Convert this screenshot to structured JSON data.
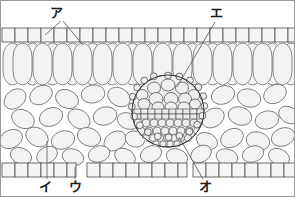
{
  "figure": {
    "type": "botanical-cross-section",
    "background_color": "#ffffff",
    "frame_color": "#9a9a9a",
    "width": 295,
    "height": 197
  },
  "style": {
    "cell_outline_color": "#4a4a4a",
    "cell_fill_color": "#f3f3f1",
    "epidermis_fill_color": "#f5f5f3",
    "bundle_outline_color": "#333333",
    "leader_line_color": "#555555",
    "label_color": "#1a1a1a"
  },
  "labels": [
    {
      "id": "a",
      "text": "ア",
      "x": 55,
      "y": 16,
      "leaders": [
        [
          60,
          20,
          44,
          34
        ],
        [
          62,
          20,
          82,
          44
        ]
      ]
    },
    {
      "id": "i",
      "text": "イ",
      "x": 44,
      "y": 190,
      "leaders": [
        [
          46,
          178,
          46,
          140
        ]
      ]
    },
    {
      "id": "u",
      "text": "ウ",
      "x": 74,
      "y": 190,
      "leaders": [
        [
          74,
          178,
          74,
          166
        ]
      ]
    },
    {
      "id": "e",
      "text": "エ",
      "x": 215,
      "y": 16,
      "leaders": [
        [
          214,
          20,
          176,
          86
        ]
      ]
    },
    {
      "id": "o",
      "text": "オ",
      "x": 204,
      "y": 190,
      "leaders": [
        [
          202,
          178,
          178,
          136
        ]
      ]
    }
  ],
  "layers": [
    {
      "name": "upper-epidermis",
      "label_ref": "a",
      "cell_shape": "rectangle",
      "cell_count": 23,
      "y_top": 27,
      "y_bottom": 41
    },
    {
      "name": "palisade-mesophyll",
      "cell_shape": "tall-oval",
      "cell_count": 24,
      "y_top": 41,
      "y_bottom": 84
    },
    {
      "name": "spongy-mesophyll",
      "label_ref": "i",
      "cell_shape": "irregular-oval",
      "cell_count": 44,
      "y_top": 84,
      "y_bottom": 162
    },
    {
      "name": "lower-epidermis",
      "label_ref": "u",
      "cell_shape": "rectangle",
      "cell_count": 21,
      "y_top": 162,
      "y_bottom": 176,
      "stomata_gaps": [
        [
          73,
          86
        ],
        [
          178,
          191
        ]
      ]
    }
  ],
  "vascular_bundle": {
    "name": "vascular-bundle",
    "center_x": 167,
    "center_y": 110,
    "radius": 36,
    "xylem": {
      "label_ref": "e",
      "description": "upper region, large rounded cells",
      "cell_rows": 3
    },
    "phloem": {
      "label_ref": "o",
      "description": "lower region, small rounded cells",
      "cell_rows": 4
    },
    "cambium_band": {
      "description": "central band of rectangular cells",
      "rows": 2
    },
    "bundle_sheath": {
      "description": "outer ring of small cells"
    }
  }
}
